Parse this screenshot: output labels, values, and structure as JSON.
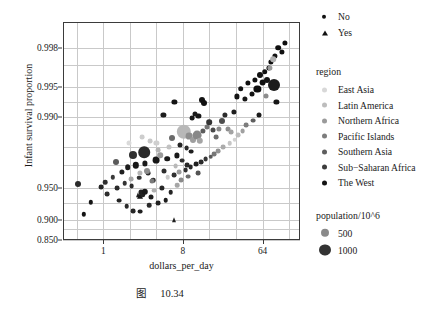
{
  "caption": {
    "figure_word": "图",
    "number": "10.34"
  },
  "axes": {
    "xlabel": "dollars_per_day",
    "ylabel": "Infant survival proportion",
    "xticks": [
      "1",
      "8",
      "64"
    ],
    "yticks": [
      "0.998",
      "0.995",
      "0.990",
      "0.950",
      "0.900",
      "0.850"
    ]
  },
  "legend": {
    "shape_entries": [
      {
        "label": "No",
        "marker": "circle"
      },
      {
        "label": "Yes",
        "marker": "triangle"
      }
    ],
    "region_title": "region",
    "regions": [
      {
        "label": "East Asia",
        "color": "#d8d8d8"
      },
      {
        "label": "Latin America",
        "color": "#bdbdbd"
      },
      {
        "label": "Northern Africa",
        "color": "#9a9a9a"
      },
      {
        "label": "Pacific Islands",
        "color": "#7d7d7d"
      },
      {
        "label": "Southern Asia",
        "color": "#5e5e5e"
      },
      {
        "label": "Sub−Saharan Africa",
        "color": "#3c3c3c"
      },
      {
        "label": "The West",
        "color": "#141414"
      }
    ],
    "size_title": "population/10^6",
    "sizes": [
      {
        "label": "500",
        "radius": 4.2,
        "color": "#8a8a8a"
      },
      {
        "label": "1000",
        "radius": 5.6,
        "color": "#333333"
      }
    ]
  },
  "chart_data": {
    "type": "scatter",
    "title": "",
    "xlabel": "dollars_per_day",
    "ylabel": "Infant survival proportion",
    "xscale": "log2",
    "yscale": "logit",
    "xlim": [
      0.35,
      170
    ],
    "ylim": [
      0.85,
      0.9989
    ],
    "xtick_values": [
      1,
      8,
      64
    ],
    "ytick_values": [
      0.998,
      0.995,
      0.99,
      0.95,
      0.9,
      0.85
    ],
    "grid": true,
    "legend_position": "right",
    "size_encodes": "population/10^6",
    "shape_encodes": "No / Yes",
    "color_encodes": "region",
    "points": [
      {
        "x": 0.72,
        "y": 0.9318,
        "r": 2.2,
        "c": "#141414",
        "s": "c"
      },
      {
        "x": 0.6,
        "y": 0.9115,
        "r": 2.2,
        "c": "#141414",
        "s": "c"
      },
      {
        "x": 0.52,
        "y": 0.9545,
        "r": 3.0,
        "c": "#2a2a2a",
        "s": "c"
      },
      {
        "x": 1.05,
        "y": 0.9562,
        "r": 2.3,
        "c": "#2f2f2f",
        "s": "c"
      },
      {
        "x": 1.28,
        "y": 0.9605,
        "r": 2.2,
        "c": "#3a3a3a",
        "s": "c"
      },
      {
        "x": 1.45,
        "y": 0.9498,
        "r": 2.4,
        "c": "#2a2a2a",
        "s": "c"
      },
      {
        "x": 1.62,
        "y": 0.9648,
        "r": 2.6,
        "c": "#1f1f1f",
        "s": "c"
      },
      {
        "x": 1.75,
        "y": 0.955,
        "r": 2.3,
        "c": "#333333",
        "s": "c"
      },
      {
        "x": 1.9,
        "y": 0.9688,
        "r": 2.8,
        "c": "#1c1c1c",
        "s": "c"
      },
      {
        "x": 2.1,
        "y": 0.952,
        "r": 2.4,
        "c": "#2c2c2c",
        "s": "c"
      },
      {
        "x": 2.35,
        "y": 0.97,
        "r": 3.2,
        "c": "#171717",
        "s": "c"
      },
      {
        "x": 2.55,
        "y": 0.9602,
        "r": 2.3,
        "c": "#363636",
        "s": "c"
      },
      {
        "x": 2.7,
        "y": 0.9455,
        "r": 2.5,
        "c": "#222222",
        "s": "c"
      },
      {
        "x": 2.95,
        "y": 0.9712,
        "r": 2.6,
        "c": "#1a1a1a",
        "s": "c"
      },
      {
        "x": 3.2,
        "y": 0.964,
        "r": 2.4,
        "c": "#303030",
        "s": "c"
      },
      {
        "x": 3.45,
        "y": 0.939,
        "r": 2.5,
        "c": "#1e1e1e",
        "s": "c"
      },
      {
        "x": 3.7,
        "y": 0.9582,
        "r": 2.3,
        "c": "#2b2b2b",
        "s": "c"
      },
      {
        "x": 3.95,
        "y": 0.9735,
        "r": 3.4,
        "c": "#161616",
        "s": "c"
      },
      {
        "x": 4.2,
        "y": 0.93,
        "r": 2.4,
        "c": "#202020",
        "s": "c"
      },
      {
        "x": 4.6,
        "y": 0.9505,
        "r": 2.6,
        "c": "#262626",
        "s": "c"
      },
      {
        "x": 4.9,
        "y": 0.966,
        "r": 2.5,
        "c": "#2e2e2e",
        "s": "c"
      },
      {
        "x": 5.3,
        "y": 0.9742,
        "r": 2.8,
        "c": "#1b1b1b",
        "s": "c"
      },
      {
        "x": 5.8,
        "y": 0.9452,
        "r": 2.3,
        "c": "#242424",
        "s": "c"
      },
      {
        "x": 6.3,
        "y": 0.9622,
        "r": 2.4,
        "c": "#313131",
        "s": "c"
      },
      {
        "x": 6.8,
        "y": 0.976,
        "r": 2.6,
        "c": "#191919",
        "s": "c"
      },
      {
        "x": 2.2,
        "y": 0.976,
        "r": 4.0,
        "c": "#2f2f2f",
        "s": "c"
      },
      {
        "x": 1.4,
        "y": 0.972,
        "r": 3.0,
        "c": "#5a5a5a",
        "s": "c"
      },
      {
        "x": 2.9,
        "y": 0.9778,
        "r": 5.8,
        "c": "#2a2a2a",
        "s": "c"
      },
      {
        "x": 3.1,
        "y": 0.9658,
        "r": 3.0,
        "c": "#8d8d8d",
        "s": "c"
      },
      {
        "x": 2.6,
        "y": 0.9645,
        "r": 2.6,
        "c": "#b5b5b5",
        "s": "c"
      },
      {
        "x": 2.05,
        "y": 0.9588,
        "r": 2.4,
        "c": "#a8a8a8",
        "s": "c"
      },
      {
        "x": 3.6,
        "y": 0.957,
        "r": 2.5,
        "c": "#7a7a7a",
        "s": "c"
      },
      {
        "x": 2.45,
        "y": 0.9412,
        "r": 2.6,
        "c": "#1f1f1f",
        "s": "t"
      },
      {
        "x": 2.6,
        "y": 0.94,
        "r": 3.0,
        "c": "#171717",
        "s": "t"
      },
      {
        "x": 2.8,
        "y": 0.943,
        "r": 2.8,
        "c": "#232323",
        "s": "c"
      },
      {
        "x": 2.95,
        "y": 0.9455,
        "r": 3.2,
        "c": "#1b1b1b",
        "s": "c"
      },
      {
        "x": 6.3,
        "y": 0.9012,
        "r": 2.6,
        "c": "#1e1e1e",
        "s": "t"
      },
      {
        "x": 2.2,
        "y": 0.918,
        "r": 2.4,
        "c": "#262626",
        "s": "c"
      },
      {
        "x": 2.6,
        "y": 0.9165,
        "r": 2.4,
        "c": "#1f1f1f",
        "s": "c"
      },
      {
        "x": 1.85,
        "y": 0.9258,
        "r": 2.3,
        "c": "#2b2b2b",
        "s": "c"
      },
      {
        "x": 1.5,
        "y": 0.934,
        "r": 2.4,
        "c": "#222222",
        "s": "c"
      },
      {
        "x": 3.3,
        "y": 0.9268,
        "r": 2.3,
        "c": "#292929",
        "s": "c"
      },
      {
        "x": 5.1,
        "y": 0.9348,
        "r": 2.3,
        "c": "#1d1d1d",
        "s": "c"
      },
      {
        "x": 1.1,
        "y": 0.9432,
        "r": 2.4,
        "c": "#2d2d2d",
        "s": "c"
      },
      {
        "x": 0.95,
        "y": 0.9512,
        "r": 2.4,
        "c": "#252525",
        "s": "c"
      },
      {
        "x": 3.8,
        "y": 0.947,
        "r": 2.4,
        "c": "#b0b0b0",
        "s": "c"
      },
      {
        "x": 4.4,
        "y": 0.9762,
        "r": 2.8,
        "c": "#9a9a9a",
        "s": "c"
      },
      {
        "x": 5.6,
        "y": 0.98,
        "r": 2.5,
        "c": "#c2c2c2",
        "s": "c"
      },
      {
        "x": 6.0,
        "y": 0.984,
        "r": 3.0,
        "c": "#6a6a6a",
        "s": "c"
      },
      {
        "x": 4.0,
        "y": 0.982,
        "r": 2.6,
        "c": "#cfcfcf",
        "s": "c"
      },
      {
        "x": 8.2,
        "y": 0.986,
        "r": 7.2,
        "c": "#b8b8b8",
        "s": "c"
      },
      {
        "x": 9.5,
        "y": 0.9845,
        "r": 3.4,
        "c": "#8f8f8f",
        "s": "c"
      },
      {
        "x": 10.5,
        "y": 0.9832,
        "r": 3.0,
        "c": "#9e9e9e",
        "s": "c"
      },
      {
        "x": 11.5,
        "y": 0.9848,
        "r": 4.4,
        "c": "#888888",
        "s": "c"
      },
      {
        "x": 12.5,
        "y": 0.9828,
        "r": 3.2,
        "c": "#a5a5a5",
        "s": "c"
      },
      {
        "x": 7.4,
        "y": 0.9812,
        "r": 2.5,
        "c": "#232323",
        "s": "c"
      },
      {
        "x": 8.8,
        "y": 0.9795,
        "r": 2.4,
        "c": "#2b2b2b",
        "s": "c"
      },
      {
        "x": 10.0,
        "y": 0.978,
        "r": 2.4,
        "c": "#1f1f1f",
        "s": "c"
      },
      {
        "x": 13.5,
        "y": 0.9862,
        "r": 2.6,
        "c": "#5c5c5c",
        "s": "c"
      },
      {
        "x": 15.0,
        "y": 0.9875,
        "r": 2.5,
        "c": "#767676",
        "s": "c"
      },
      {
        "x": 7.8,
        "y": 0.973,
        "r": 2.4,
        "c": "#303030",
        "s": "c"
      },
      {
        "x": 9.0,
        "y": 0.97,
        "r": 2.4,
        "c": "#282828",
        "s": "c"
      },
      {
        "x": 6.6,
        "y": 0.9692,
        "r": 2.4,
        "c": "#b9b9b9",
        "s": "c"
      },
      {
        "x": 7.2,
        "y": 0.9648,
        "r": 2.4,
        "c": "#9c9c9c",
        "s": "c"
      },
      {
        "x": 5.4,
        "y": 0.9608,
        "r": 2.3,
        "c": "#cacaca",
        "s": "c"
      },
      {
        "x": 12.0,
        "y": 0.9902,
        "r": 2.6,
        "c": "#161616",
        "s": "c"
      },
      {
        "x": 13.0,
        "y": 0.9932,
        "r": 3.0,
        "c": "#121212",
        "s": "c"
      },
      {
        "x": 13.8,
        "y": 0.9928,
        "r": 3.0,
        "c": "#101010",
        "s": "c"
      },
      {
        "x": 6.4,
        "y": 0.993,
        "r": 2.6,
        "c": "#141414",
        "s": "c"
      },
      {
        "x": 11.0,
        "y": 0.9908,
        "r": 2.5,
        "c": "#1a1a1a",
        "s": "c"
      },
      {
        "x": 10.2,
        "y": 0.9898,
        "r": 2.4,
        "c": "#181818",
        "s": "c"
      },
      {
        "x": 16.0,
        "y": 0.9888,
        "r": 2.8,
        "c": "#343434",
        "s": "c"
      },
      {
        "x": 17.5,
        "y": 0.9866,
        "r": 2.5,
        "c": "#4a4a4a",
        "s": "c"
      },
      {
        "x": 19.0,
        "y": 0.9842,
        "r": 2.4,
        "c": "#6e6e6e",
        "s": "c"
      },
      {
        "x": 20.5,
        "y": 0.987,
        "r": 2.6,
        "c": "#8a8a8a",
        "s": "c"
      },
      {
        "x": 22.0,
        "y": 0.9892,
        "r": 3.0,
        "c": "#4d4d4d",
        "s": "c"
      },
      {
        "x": 24.0,
        "y": 0.9905,
        "r": 2.6,
        "c": "#2c2c2c",
        "s": "c"
      },
      {
        "x": 26.0,
        "y": 0.987,
        "r": 2.5,
        "c": "#8e8e8e",
        "s": "c"
      },
      {
        "x": 28.0,
        "y": 0.9858,
        "r": 2.4,
        "c": "#a3a3a3",
        "s": "c"
      },
      {
        "x": 30.0,
        "y": 0.9912,
        "r": 2.6,
        "c": "#1e1e1e",
        "s": "c"
      },
      {
        "x": 33.0,
        "y": 0.9938,
        "r": 2.6,
        "c": "#141414",
        "s": "c"
      },
      {
        "x": 36.0,
        "y": 0.9948,
        "r": 2.8,
        "c": "#111111",
        "s": "c"
      },
      {
        "x": 40.0,
        "y": 0.9935,
        "r": 2.6,
        "c": "#161616",
        "s": "c"
      },
      {
        "x": 44.0,
        "y": 0.9955,
        "r": 2.6,
        "c": "#0f0f0f",
        "s": "c"
      },
      {
        "x": 48.0,
        "y": 0.9942,
        "r": 2.5,
        "c": "#131313",
        "s": "c"
      },
      {
        "x": 52.0,
        "y": 0.9958,
        "r": 2.6,
        "c": "#101010",
        "s": "c"
      },
      {
        "x": 56.0,
        "y": 0.9948,
        "r": 3.6,
        "c": "#0d0d0d",
        "s": "c"
      },
      {
        "x": 60.0,
        "y": 0.9962,
        "r": 3.0,
        "c": "#121212",
        "s": "c"
      },
      {
        "x": 64.0,
        "y": 0.9955,
        "r": 3.4,
        "c": "#0f0f0f",
        "s": "c"
      },
      {
        "x": 68.0,
        "y": 0.9965,
        "r": 2.8,
        "c": "#111111",
        "s": "c"
      },
      {
        "x": 72.0,
        "y": 0.9958,
        "r": 3.0,
        "c": "#141414",
        "s": "c"
      },
      {
        "x": 76.0,
        "y": 0.9968,
        "r": 2.6,
        "c": "#101010",
        "s": "c"
      },
      {
        "x": 80.0,
        "y": 0.9972,
        "r": 2.6,
        "c": "#0e0e0e",
        "s": "c"
      },
      {
        "x": 88.0,
        "y": 0.9976,
        "r": 2.6,
        "c": "#121212",
        "s": "c"
      },
      {
        "x": 96.0,
        "y": 0.998,
        "r": 2.8,
        "c": "#0f0f0f",
        "s": "c"
      },
      {
        "x": 105.0,
        "y": 0.9978,
        "r": 2.6,
        "c": "#111111",
        "s": "c"
      },
      {
        "x": 115.0,
        "y": 0.9982,
        "r": 2.6,
        "c": "#0d0d0d",
        "s": "c"
      },
      {
        "x": 86.0,
        "y": 0.9952,
        "r": 6.0,
        "c": "#1c1c1c",
        "s": "c"
      },
      {
        "x": 92.0,
        "y": 0.993,
        "r": 2.6,
        "c": "#171717",
        "s": "c"
      },
      {
        "x": 70.0,
        "y": 0.9938,
        "r": 2.5,
        "c": "#8c8c8c",
        "s": "c"
      },
      {
        "x": 78.0,
        "y": 0.9968,
        "r": 2.6,
        "c": "#9a9a9a",
        "s": "c"
      },
      {
        "x": 84.0,
        "y": 0.9974,
        "r": 2.8,
        "c": "#b0b0b0",
        "s": "c"
      },
      {
        "x": 58.0,
        "y": 0.9905,
        "r": 2.5,
        "c": "#1b1b1b",
        "s": "c"
      },
      {
        "x": 50.0,
        "y": 0.9892,
        "r": 2.4,
        "c": "#5f5f5f",
        "s": "c"
      },
      {
        "x": 42.0,
        "y": 0.988,
        "r": 2.4,
        "c": "#7c7c7c",
        "s": "c"
      },
      {
        "x": 38.0,
        "y": 0.9862,
        "r": 2.4,
        "c": "#a0a0a0",
        "s": "c"
      },
      {
        "x": 34.0,
        "y": 0.9848,
        "r": 2.4,
        "c": "#bdbdbd",
        "s": "c"
      },
      {
        "x": 31.0,
        "y": 0.9832,
        "r": 2.3,
        "c": "#d2d2d2",
        "s": "c"
      },
      {
        "x": 27.0,
        "y": 0.9818,
        "r": 2.3,
        "c": "#c6c6c6",
        "s": "c"
      },
      {
        "x": 23.0,
        "y": 0.98,
        "r": 2.4,
        "c": "#ababab",
        "s": "c"
      },
      {
        "x": 20.0,
        "y": 0.9782,
        "r": 2.4,
        "c": "#949494",
        "s": "c"
      },
      {
        "x": 18.0,
        "y": 0.9768,
        "r": 2.4,
        "c": "#787878",
        "s": "c"
      },
      {
        "x": 16.5,
        "y": 0.9752,
        "r": 2.3,
        "c": "#5a5a5a",
        "s": "c"
      },
      {
        "x": 14.5,
        "y": 0.9738,
        "r": 2.4,
        "c": "#373737",
        "s": "c"
      },
      {
        "x": 12.8,
        "y": 0.9722,
        "r": 2.4,
        "c": "#2a2a2a",
        "s": "c"
      },
      {
        "x": 11.2,
        "y": 0.9706,
        "r": 2.4,
        "c": "#1f1f1f",
        "s": "c"
      },
      {
        "x": 9.8,
        "y": 0.9688,
        "r": 2.4,
        "c": "#262626",
        "s": "c"
      },
      {
        "x": 8.6,
        "y": 0.9668,
        "r": 2.4,
        "c": "#313131",
        "s": "c"
      },
      {
        "x": 7.6,
        "y": 0.9582,
        "r": 2.4,
        "c": "#8b8b8b",
        "s": "c"
      },
      {
        "x": 6.9,
        "y": 0.9528,
        "r": 2.3,
        "c": "#a6a6a6",
        "s": "c"
      },
      {
        "x": 9.2,
        "y": 0.9612,
        "r": 2.4,
        "c": "#6d6d6d",
        "s": "c"
      },
      {
        "x": 11.8,
        "y": 0.9642,
        "r": 2.4,
        "c": "#545454",
        "s": "c"
      },
      {
        "x": 4.8,
        "y": 0.9905,
        "r": 2.6,
        "c": "#1d1d1d",
        "s": "c"
      },
      {
        "x": 3.4,
        "y": 0.9828,
        "r": 2.4,
        "c": "#c8c8c8",
        "s": "c"
      },
      {
        "x": 4.2,
        "y": 0.9788,
        "r": 2.4,
        "c": "#b4b4b4",
        "s": "c"
      },
      {
        "x": 1.95,
        "y": 0.9818,
        "r": 2.5,
        "c": "#dadada",
        "s": "c"
      },
      {
        "x": 2.75,
        "y": 0.9842,
        "r": 2.4,
        "c": "#cdcdcd",
        "s": "c"
      }
    ]
  }
}
